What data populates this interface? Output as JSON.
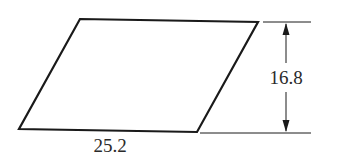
{
  "figure": {
    "shape": "parallelogram",
    "vertices": {
      "top_left": [
        80,
        19
      ],
      "top_right": [
        258,
        22
      ],
      "bottom_right": [
        197,
        132
      ],
      "bottom_left": [
        19,
        129
      ]
    },
    "base_label": "25.2",
    "height_label": "16.8",
    "colors": {
      "stroke": "#1a1a1a",
      "background": "#ffffff"
    }
  }
}
